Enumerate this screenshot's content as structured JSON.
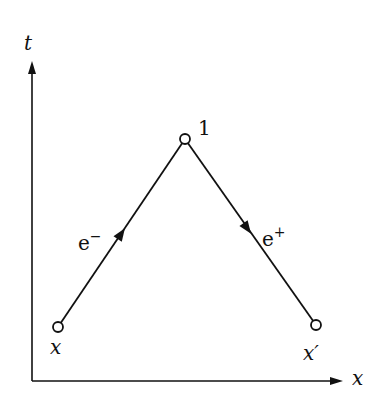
{
  "diagram": {
    "type": "spacetime-diagram",
    "axes": {
      "vertical_label": "t",
      "horizontal_label": "x"
    },
    "vertices": [
      {
        "id": "x",
        "label": "x",
        "pos": [
          58,
          327
        ]
      },
      {
        "id": "1",
        "label": "1",
        "pos": [
          185,
          139
        ]
      },
      {
        "id": "xprime",
        "label": "x′",
        "pos": [
          316,
          325
        ]
      }
    ],
    "lines": [
      {
        "from": "x",
        "to": "1",
        "label": "e⁻",
        "label_base": "e",
        "label_sup": "−",
        "arrow": "toward 1"
      },
      {
        "from": "1",
        "to": "xprime",
        "label": "e⁺",
        "label_base": "e",
        "label_sup": "+",
        "arrow": "toward x′"
      }
    ],
    "colors": {
      "ink": "#111111",
      "background": "#ffffff"
    }
  }
}
